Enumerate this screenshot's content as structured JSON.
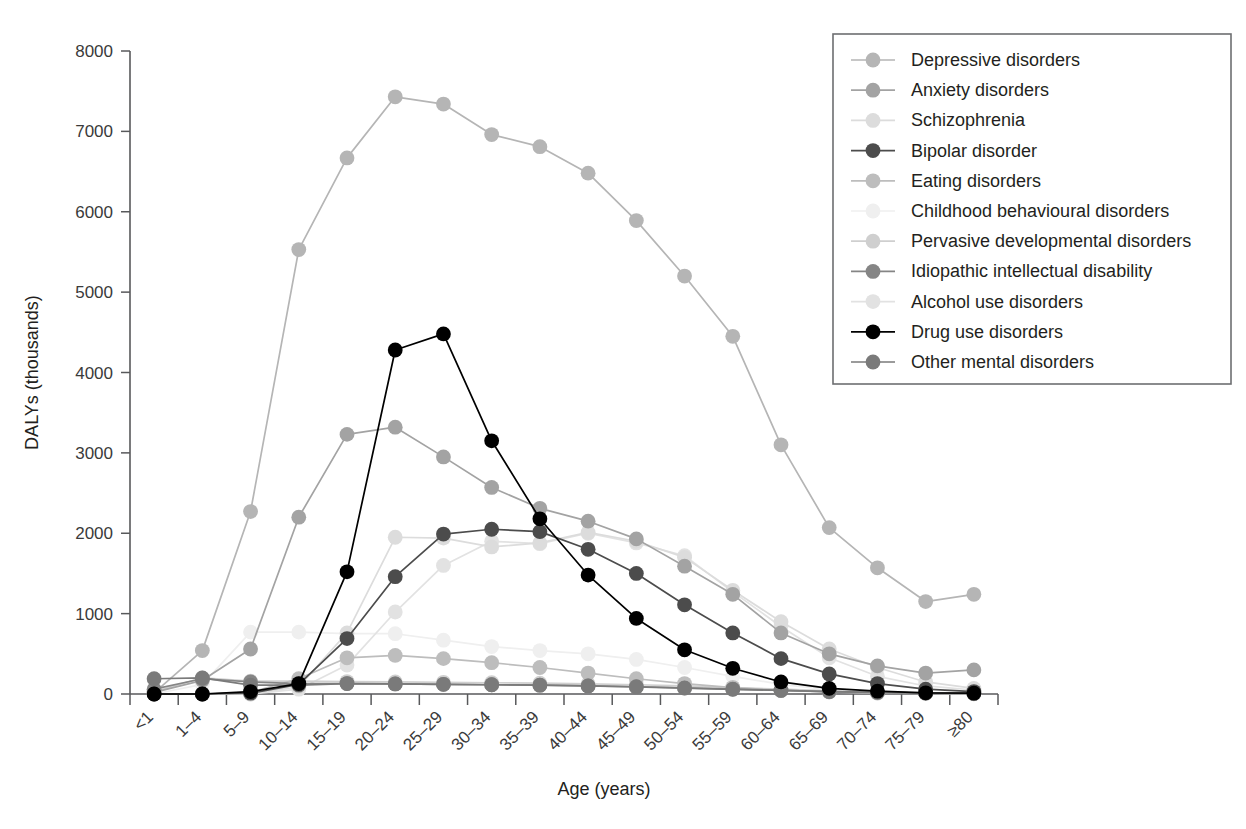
{
  "chart_data": {
    "type": "line",
    "title": "",
    "xlabel": "Age (years)",
    "ylabel": "DALYs (thousands)",
    "ylim": [
      0,
      8000
    ],
    "yticks": [
      0,
      1000,
      2000,
      3000,
      4000,
      5000,
      6000,
      7000,
      8000
    ],
    "ytick_labels": [
      "0",
      "1000",
      "2000",
      "3000",
      "4000",
      "5000",
      "6000",
      "7000",
      "8000"
    ],
    "grid": false,
    "legend_position": "top-right",
    "categories": [
      "<1",
      "1–4",
      "5–9",
      "10–14",
      "15–19",
      "20–24",
      "25–29",
      "30–34",
      "35–39",
      "40–44",
      "45–49",
      "50–54",
      "55–59",
      "60–64",
      "65–69",
      "70–74",
      "75–79",
      "≥80"
    ],
    "series": [
      {
        "name": "Depressive disorders",
        "color": "#b5b5b5",
        "values": [
          15,
          540,
          2270,
          5530,
          6670,
          7430,
          7340,
          6960,
          6810,
          6480,
          5890,
          5200,
          4450,
          3100,
          2070,
          1570,
          1150,
          1240
        ]
      },
      {
        "name": "Anxiety disorders",
        "color": "#a3a3a3",
        "values": [
          20,
          170,
          560,
          2200,
          3230,
          3320,
          2950,
          2570,
          2310,
          2150,
          1930,
          1590,
          1240,
          760,
          500,
          350,
          260,
          300
        ]
      },
      {
        "name": "Schizophrenia",
        "color": "#dcdcdc",
        "values": [
          0,
          0,
          0,
          90,
          760,
          1950,
          1940,
          1830,
          1880,
          2010,
          1900,
          1700,
          1290,
          900,
          560,
          330,
          150,
          70
        ]
      },
      {
        "name": "Bipolar disorder",
        "color": "#4c4c4c",
        "values": [
          0,
          0,
          10,
          120,
          690,
          1460,
          1990,
          2050,
          2020,
          1800,
          1500,
          1110,
          760,
          440,
          250,
          130,
          60,
          30
        ]
      },
      {
        "name": "Eating disorders",
        "color": "#bdbdbd",
        "values": [
          0,
          0,
          20,
          190,
          450,
          480,
          440,
          390,
          330,
          260,
          190,
          130,
          80,
          45,
          25,
          12,
          6,
          3
        ]
      },
      {
        "name": "Childhood behavioural disorders",
        "color": "#efefef",
        "values": [
          0,
          120,
          770,
          770,
          750,
          750,
          670,
          590,
          540,
          500,
          430,
          330,
          220,
          120,
          55,
          25,
          10,
          5
        ]
      },
      {
        "name": "Pervasive developmental disorders",
        "color": "#cfcfcf",
        "values": [
          30,
          200,
          160,
          160,
          155,
          150,
          145,
          140,
          135,
          125,
          115,
          100,
          80,
          60,
          40,
          25,
          15,
          10
        ]
      },
      {
        "name": "Idiopathic intellectual disability",
        "color": "#858585",
        "values": [
          60,
          190,
          150,
          130,
          130,
          125,
          120,
          115,
          110,
          100,
          90,
          75,
          60,
          45,
          30,
          20,
          12,
          8
        ]
      },
      {
        "name": "Alcohol use disorders",
        "color": "#e2e2e2",
        "values": [
          0,
          0,
          0,
          60,
          360,
          1020,
          1600,
          1900,
          1870,
          2000,
          1880,
          1720,
          1270,
          840,
          450,
          220,
          100,
          50
        ]
      },
      {
        "name": "Drug use disorders",
        "color": "#000000",
        "values": [
          0,
          0,
          30,
          130,
          1520,
          4280,
          4480,
          3150,
          2180,
          1480,
          940,
          550,
          320,
          150,
          70,
          35,
          15,
          10
        ]
      },
      {
        "name": "Other mental disorders",
        "color": "#7a7a7a",
        "values": [
          190,
          200,
          110,
          110,
          130,
          125,
          120,
          115,
          110,
          100,
          88,
          72,
          58,
          44,
          30,
          20,
          13,
          9
        ]
      }
    ]
  },
  "legend": {
    "items": [
      {
        "label": "Depressive disorders",
        "color": "#b5b5b5"
      },
      {
        "label": "Anxiety disorders",
        "color": "#a3a3a3"
      },
      {
        "label": "Schizophrenia",
        "color": "#dcdcdc"
      },
      {
        "label": "Bipolar disorder",
        "color": "#4c4c4c"
      },
      {
        "label": "Eating disorders",
        "color": "#bdbdbd"
      },
      {
        "label": "Childhood behavioural disorders",
        "color": "#efefef"
      },
      {
        "label": "Pervasive developmental disorders",
        "color": "#cfcfcf"
      },
      {
        "label": "Idiopathic intellectual disability",
        "color": "#858585"
      },
      {
        "label": "Alcohol use disorders",
        "color": "#e2e2e2"
      },
      {
        "label": "Drug use disorders",
        "color": "#000000"
      },
      {
        "label": "Other mental disorders",
        "color": "#7a7a7a"
      }
    ]
  }
}
